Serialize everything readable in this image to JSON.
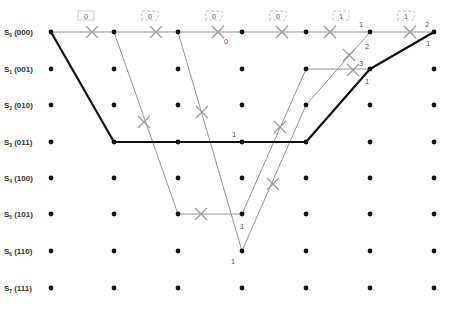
{
  "colors": {
    "node": "#111111",
    "thin_edge": "#888888",
    "survivor_path": "#111111",
    "cross_mark": "#999999",
    "label": "#333333",
    "box_border": "#bbbbbb"
  },
  "layout": {
    "columns_x": [
      51,
      114,
      178,
      242,
      306,
      370,
      434
    ],
    "rows_y": [
      32,
      69,
      105,
      142,
      178,
      214,
      251,
      288
    ]
  },
  "states": [
    {
      "name": "S",
      "sub": "0",
      "bits": "(000)"
    },
    {
      "name": "S",
      "sub": "1",
      "bits": "(001)"
    },
    {
      "name": "S",
      "sub": "2",
      "bits": "(010)"
    },
    {
      "name": "S",
      "sub": "3",
      "bits": "(011)"
    },
    {
      "name": "S",
      "sub": "4",
      "bits": "(100)"
    },
    {
      "name": "S",
      "sub": "5",
      "bits": "(101)"
    },
    {
      "name": "S",
      "sub": "6",
      "bits": "(110)"
    },
    {
      "name": "S",
      "sub": "7",
      "bits": "(111)"
    }
  ],
  "received_bits": [
    {
      "x": 86,
      "label": "0",
      "style": "solid"
    },
    {
      "x": 150,
      "label": "0",
      "style": "dashed"
    },
    {
      "x": 214,
      "label": "0",
      "style": "dashed"
    },
    {
      "x": 278,
      "label": "0",
      "style": "dashed"
    },
    {
      "x": 341,
      "label": "1",
      "style": "dashed"
    },
    {
      "x": 406,
      "label": "1",
      "style": "dashed"
    }
  ],
  "thin_edges": [
    {
      "from": [
        0,
        0
      ],
      "to": [
        6,
        0
      ]
    },
    {
      "from": [
        1,
        0
      ],
      "to": [
        2,
        5
      ]
    },
    {
      "from": [
        2,
        5
      ],
      "to": [
        3,
        5
      ]
    },
    {
      "from": [
        2,
        0
      ],
      "to": [
        3,
        6
      ]
    },
    {
      "from": [
        3,
        5
      ],
      "to": [
        4,
        1
      ]
    },
    {
      "from": [
        4,
        1
      ],
      "to": [
        5,
        1
      ]
    },
    {
      "from": [
        3,
        6
      ],
      "to": [
        4,
        2
      ]
    },
    {
      "from": [
        4,
        2
      ],
      "to": [
        5,
        0
      ]
    }
  ],
  "survivor_path": [
    [
      0,
      0
    ],
    [
      1,
      3
    ],
    [
      2,
      3
    ],
    [
      3,
      3
    ],
    [
      4,
      3
    ],
    [
      5,
      1
    ],
    [
      6,
      0
    ]
  ],
  "cross_marks": [
    {
      "x": 92,
      "y": 32
    },
    {
      "x": 156,
      "y": 32
    },
    {
      "x": 218,
      "y": 32
    },
    {
      "x": 282,
      "y": 32
    },
    {
      "x": 330,
      "y": 32
    },
    {
      "x": 410,
      "y": 32
    },
    {
      "x": 144,
      "y": 122
    },
    {
      "x": 202,
      "y": 112
    },
    {
      "x": 201,
      "y": 214
    },
    {
      "x": 280,
      "y": 127
    },
    {
      "x": 273,
      "y": 184
    },
    {
      "x": 349,
      "y": 55
    },
    {
      "x": 353,
      "y": 70
    }
  ],
  "metrics": [
    {
      "x": 224,
      "y": 44,
      "text": "0"
    },
    {
      "x": 232,
      "y": 137,
      "text": "1"
    },
    {
      "x": 240,
      "y": 229,
      "text": "1"
    },
    {
      "x": 231,
      "y": 264,
      "text": "1"
    },
    {
      "x": 359,
      "y": 27,
      "text": "1"
    },
    {
      "x": 365,
      "y": 49,
      "text": "2"
    },
    {
      "x": 359,
      "y": 66,
      "text": "3"
    },
    {
      "x": 365,
      "y": 84,
      "text": "1"
    },
    {
      "x": 425,
      "y": 27,
      "text": "2"
    },
    {
      "x": 426,
      "y": 46,
      "text": "1"
    }
  ]
}
